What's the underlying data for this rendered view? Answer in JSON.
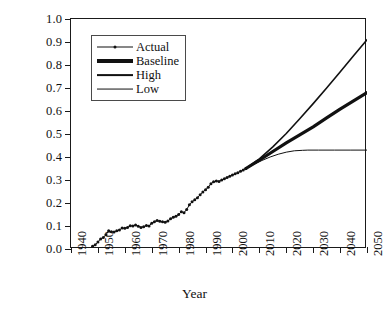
{
  "chart_data": {
    "type": "line",
    "title": "",
    "xlabel": "Year",
    "ylabel": "Technological change",
    "xlim": [
      1940,
      2050
    ],
    "ylim": [
      0.0,
      1.0
    ],
    "xticks": [
      1940,
      1950,
      1960,
      1970,
      1980,
      1990,
      2000,
      2010,
      2020,
      2030,
      2040,
      2050
    ],
    "yticks": [
      0.0,
      0.1,
      0.2,
      0.3,
      0.4,
      0.5,
      0.6,
      0.7,
      0.8,
      0.9,
      1.0
    ],
    "xtick_labels": [
      "1940",
      "1950",
      "1960",
      "1970",
      "1980",
      "1990",
      "2000",
      "2010",
      "2020",
      "2030",
      "2040",
      "2050"
    ],
    "ytick_labels": [
      "0.0",
      "0.1",
      "0.2",
      "0.3",
      "0.4",
      "0.5",
      "0.6",
      "0.7",
      "0.8",
      "0.9",
      "1.0"
    ],
    "grid": false,
    "legend_position": "upper left",
    "line_color": "#111111",
    "series": [
      {
        "name": "Actual",
        "style": "thin-line-with-dot-markers",
        "marker": "dot",
        "linewidth": 1.0,
        "x": [
          1948,
          1949,
          1950,
          1951,
          1952,
          1953,
          1954,
          1955,
          1956,
          1957,
          1958,
          1959,
          1960,
          1961,
          1962,
          1963,
          1964,
          1965,
          1966,
          1967,
          1968,
          1969,
          1970,
          1971,
          1972,
          1973,
          1974,
          1975,
          1976,
          1977,
          1978,
          1979,
          1980,
          1981,
          1982,
          1983,
          1984,
          1985,
          1986,
          1987,
          1988,
          1989,
          1990,
          1991,
          1992,
          1993,
          1994,
          1995,
          1996,
          1997,
          1998,
          1999,
          2000,
          2001,
          2002,
          2003,
          2004,
          2005
        ],
        "y": [
          0.012,
          0.018,
          0.03,
          0.044,
          0.05,
          0.062,
          0.079,
          0.075,
          0.074,
          0.079,
          0.083,
          0.091,
          0.09,
          0.094,
          0.101,
          0.1,
          0.104,
          0.099,
          0.094,
          0.097,
          0.102,
          0.1,
          0.112,
          0.119,
          0.124,
          0.121,
          0.118,
          0.116,
          0.122,
          0.131,
          0.138,
          0.142,
          0.15,
          0.162,
          0.158,
          0.172,
          0.192,
          0.205,
          0.214,
          0.223,
          0.236,
          0.248,
          0.258,
          0.268,
          0.284,
          0.292,
          0.296,
          0.294,
          0.3,
          0.305,
          0.311,
          0.316,
          0.322,
          0.327,
          0.332,
          0.338,
          0.344,
          0.35
        ]
      },
      {
        "name": "Baseline",
        "style": "thick-line",
        "linewidth": 3.2,
        "x": [
          2005,
          2010,
          2015,
          2020,
          2025,
          2030,
          2035,
          2040,
          2045,
          2050
        ],
        "y": [
          0.35,
          0.386,
          0.424,
          0.461,
          0.496,
          0.531,
          0.57,
          0.608,
          0.644,
          0.68
        ]
      },
      {
        "name": "High",
        "style": "medium-line",
        "linewidth": 1.6,
        "x": [
          2005,
          2010,
          2015,
          2020,
          2025,
          2030,
          2035,
          2040,
          2045,
          2050
        ],
        "y": [
          0.35,
          0.392,
          0.444,
          0.502,
          0.566,
          0.632,
          0.7,
          0.77,
          0.84,
          0.91
        ]
      },
      {
        "name": "Low",
        "style": "thin-line",
        "linewidth": 1.0,
        "x": [
          2005,
          2008,
          2011,
          2014,
          2017,
          2020,
          2023,
          2026,
          2028,
          2032,
          2038,
          2044,
          2050
        ],
        "y": [
          0.35,
          0.368,
          0.385,
          0.4,
          0.412,
          0.421,
          0.427,
          0.429,
          0.43,
          0.43,
          0.43,
          0.43,
          0.43
        ]
      }
    ]
  },
  "legend": {
    "items": [
      {
        "label": "Actual",
        "style": "thin-line-with-dot-markers"
      },
      {
        "label": "Baseline",
        "style": "thick-line"
      },
      {
        "label": "High",
        "style": "medium-line"
      },
      {
        "label": "Low",
        "style": "thin-line"
      }
    ]
  }
}
